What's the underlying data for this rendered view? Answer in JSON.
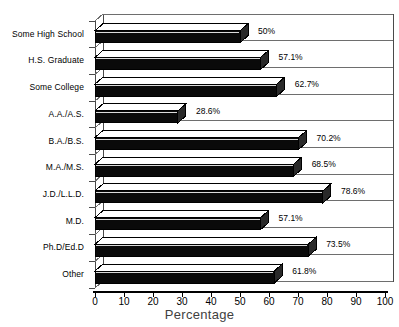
{
  "chart_data": {
    "type": "bar",
    "orientation": "horizontal",
    "title": "",
    "xlabel": "Percentage",
    "ylabel": "",
    "xlim": [
      0,
      100
    ],
    "xticks": [
      0,
      10,
      20,
      30,
      40,
      50,
      60,
      70,
      80,
      90,
      100
    ],
    "grid": true,
    "legend": "none",
    "style": "3d-bar",
    "bar_color": "#000000",
    "categories": [
      "Some High School",
      "H.S. Graduate",
      "Some College",
      "A.A./A.S.",
      "B.A./B.S.",
      "M.A./M.S.",
      "J.D./L.L.D.",
      "M.D.",
      "Ph.D/Ed.D",
      "Other"
    ],
    "values": [
      50,
      57.1,
      62.7,
      28.6,
      70.2,
      68.5,
      78.6,
      57.1,
      73.5,
      61.8
    ],
    "value_labels": [
      "50%",
      "57.1%",
      "62.7%",
      "28.6%",
      "70.2%",
      "68.5%",
      "78.6%",
      "57.1%",
      "73.5%",
      "61.8%"
    ]
  },
  "axis": {
    "x_title": "Percentage",
    "tick_labels": [
      "0",
      "10",
      "20",
      "30",
      "40",
      "50",
      "60",
      "70",
      "80",
      "90",
      "100"
    ]
  },
  "header": {
    "title": ""
  }
}
